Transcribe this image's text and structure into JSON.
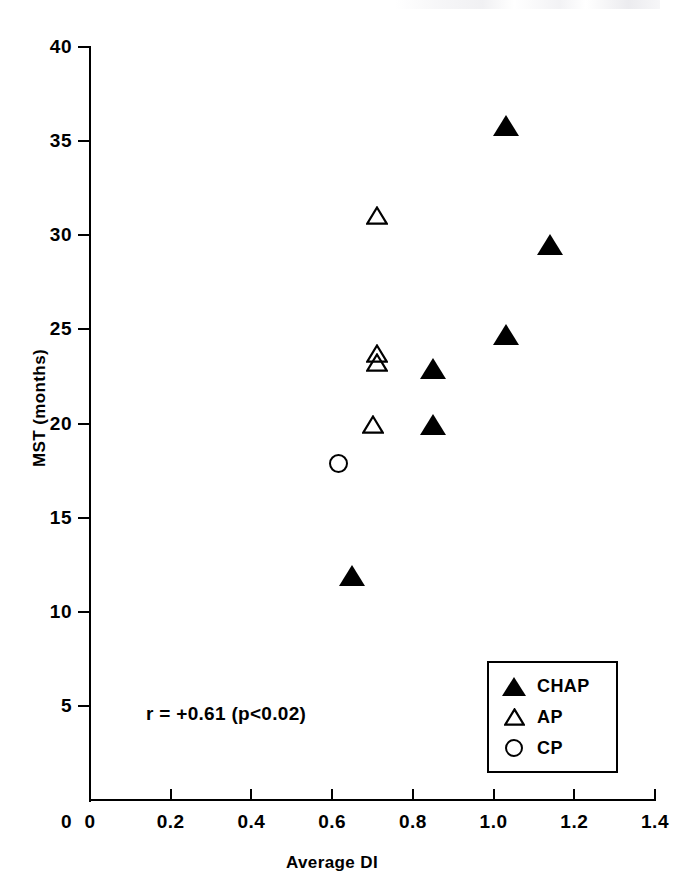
{
  "chart_data": {
    "type": "scatter",
    "title": "",
    "xlabel": "Average DI",
    "ylabel": "MST (months)",
    "xlim": [
      0,
      1.4
    ],
    "ylim": [
      0,
      40
    ],
    "xticks": [
      "0",
      "0.2",
      "0.4",
      "0.6",
      "0.8",
      "1.0",
      "1.2",
      "1.4"
    ],
    "xtick_values": [
      0,
      0.2,
      0.4,
      0.6,
      0.8,
      1.0,
      1.2,
      1.4
    ],
    "yticks": [
      "0",
      "5",
      "10",
      "15",
      "20",
      "25",
      "30",
      "35",
      "40"
    ],
    "ytick_values": [
      0,
      5,
      10,
      15,
      20,
      25,
      30,
      35,
      40
    ],
    "grid": false,
    "legend_position": "bottom-right",
    "annotation": "r = +0.61 (p<0.02)",
    "series": [
      {
        "name": "CHAP",
        "marker": "filled-triangle",
        "color": "#000000",
        "points": [
          {
            "x": 0.65,
            "y": 11.9
          },
          {
            "x": 0.85,
            "y": 19.9
          },
          {
            "x": 0.85,
            "y": 22.9
          },
          {
            "x": 1.03,
            "y": 24.7
          },
          {
            "x": 1.14,
            "y": 29.5
          },
          {
            "x": 1.03,
            "y": 35.8
          }
        ]
      },
      {
        "name": "AP",
        "marker": "open-triangle",
        "color": "#000000",
        "points": [
          {
            "x": 0.7,
            "y": 19.9
          },
          {
            "x": 0.71,
            "y": 23.2
          },
          {
            "x": 0.71,
            "y": 23.7
          },
          {
            "x": 0.71,
            "y": 31.0
          }
        ]
      },
      {
        "name": "CP",
        "marker": "open-circle",
        "color": "#000000",
        "points": [
          {
            "x": 0.615,
            "y": 17.9
          }
        ]
      }
    ]
  },
  "legend": {
    "items": [
      {
        "label": "CHAP",
        "symbol": "filled-triangle-icon"
      },
      {
        "label": "AP",
        "symbol": "open-triangle-icon"
      },
      {
        "label": "CP",
        "symbol": "open-circle-icon"
      }
    ]
  }
}
